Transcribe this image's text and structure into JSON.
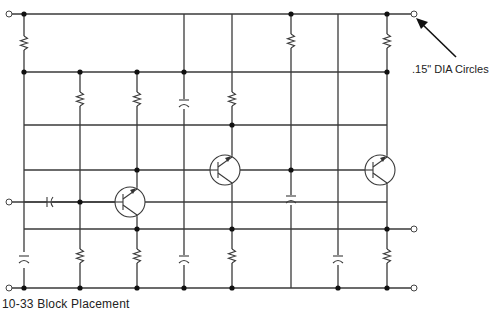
{
  "callout": {
    "text": ".15\" DIA Circles",
    "arrow_target": [
      414,
      16
    ],
    "arrow_tail": [
      456,
      57
    ]
  },
  "caption": {
    "text": "10-33 Block Placement"
  },
  "colors": {
    "wire": "#3a3a3a",
    "node": "#111111",
    "terminal_fill": "#ffffff",
    "background": "#ffffff"
  },
  "grid": {
    "rails_y": [
      14,
      72,
      125,
      170,
      202,
      229,
      288
    ],
    "columns_x": [
      24,
      80,
      137,
      184,
      232,
      291,
      338,
      387
    ],
    "left_x": 24,
    "right_x": 387
  },
  "components": {
    "resistors": [
      {
        "id": "R1",
        "x": 24,
        "y1": 14,
        "y2": 72
      },
      {
        "id": "R2",
        "x": 80,
        "y1": 72,
        "y2": 125
      },
      {
        "id": "R3",
        "x": 137,
        "y1": 72,
        "y2": 125
      },
      {
        "id": "R4",
        "x": 232,
        "y1": 72,
        "y2": 125
      },
      {
        "id": "R5",
        "x": 291,
        "y1": 14,
        "y2": 72
      },
      {
        "id": "R6",
        "x": 387,
        "y1": 14,
        "y2": 72
      },
      {
        "id": "R7",
        "x": 80,
        "y1": 229,
        "y2": 288
      },
      {
        "id": "R8",
        "x": 137,
        "y1": 229,
        "y2": 288
      },
      {
        "id": "R9",
        "x": 232,
        "y1": 229,
        "y2": 288
      },
      {
        "id": "R10",
        "x": 387,
        "y1": 229,
        "y2": 288
      }
    ],
    "capacitors": [
      {
        "id": "C1",
        "x": 184,
        "y": 104,
        "orient": "vertical"
      },
      {
        "id": "C2",
        "x": 291,
        "y": 200,
        "orient": "vertical"
      },
      {
        "id": "C3",
        "x": 24,
        "y": 260,
        "orient": "vertical"
      },
      {
        "id": "C4",
        "x": 184,
        "y": 260,
        "orient": "vertical"
      },
      {
        "id": "C5",
        "x": 338,
        "y": 260,
        "orient": "vertical"
      },
      {
        "id": "C6",
        "x": 50,
        "y": 202,
        "orient": "horizontal"
      }
    ],
    "transistors": [
      {
        "id": "Q1",
        "cx": 130,
        "cy": 202,
        "r": 15,
        "base_y": 202,
        "collector_x": 137
      },
      {
        "id": "Q2",
        "cx": 225,
        "cy": 170,
        "r": 15,
        "base_y": 170,
        "collector_x": 232
      },
      {
        "id": "Q3",
        "cx": 380,
        "cy": 170,
        "r": 15,
        "base_y": 170,
        "collector_x": 387
      }
    ],
    "nodes": [
      [
        24,
        14
      ],
      [
        24,
        72
      ],
      [
        80,
        72
      ],
      [
        137,
        72
      ],
      [
        184,
        72
      ],
      [
        291,
        14
      ],
      [
        387,
        14
      ],
      [
        387,
        72
      ],
      [
        232,
        125
      ],
      [
        137,
        170
      ],
      [
        291,
        170
      ],
      [
        80,
        202
      ],
      [
        137,
        229
      ],
      [
        232,
        229
      ],
      [
        387,
        229
      ],
      [
        24,
        288
      ],
      [
        80,
        288
      ],
      [
        137,
        288
      ],
      [
        184,
        288
      ],
      [
        232,
        288
      ],
      [
        338,
        288
      ],
      [
        387,
        288
      ]
    ],
    "terminals": [
      [
        9,
        14
      ],
      [
        414,
        14
      ],
      [
        9,
        202
      ],
      [
        9,
        288
      ],
      [
        414,
        229
      ],
      [
        414,
        288
      ]
    ]
  }
}
